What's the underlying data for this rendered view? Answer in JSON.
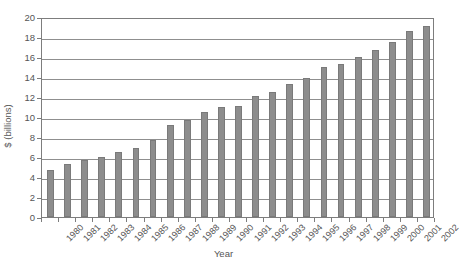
{
  "chart_data": {
    "type": "bar",
    "title": "",
    "xlabel": "Year",
    "ylabel": "$ (billions)",
    "ylim": [
      0,
      20
    ],
    "ytick_step": 2,
    "yticks": [
      "20",
      "18",
      "16",
      "14",
      "12",
      "10",
      "8",
      "6",
      "4",
      "2",
      "0"
    ],
    "grid": true,
    "legend": "none",
    "bar_color": "#8d8d8d",
    "bar_edge_color": "#7a7a7a",
    "axis_color": "#7d7d7d",
    "categories": [
      "1980",
      "1981",
      "1982",
      "1983",
      "1984",
      "1985",
      "1986",
      "1987",
      "1988",
      "1989",
      "1990",
      "1991",
      "1992",
      "1993",
      "1994",
      "1995",
      "1996",
      "1997",
      "1998",
      "1999",
      "2000",
      "2001",
      "2002"
    ],
    "values": [
      4.7,
      5.3,
      5.7,
      6.0,
      6.5,
      6.9,
      7.7,
      9.2,
      9.7,
      10.5,
      11.0,
      11.1,
      12.1,
      12.5,
      13.3,
      13.9,
      15.0,
      15.35,
      16.05,
      16.75,
      17.5,
      18.6,
      19.1
    ]
  },
  "caption": ""
}
